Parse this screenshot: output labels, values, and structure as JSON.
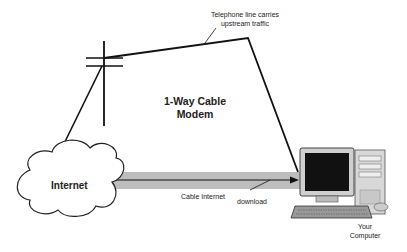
{
  "diagram": {
    "title_line1": "1-Way Cable",
    "title_line2": "Modem",
    "labels": {
      "telephone_line_1": "Telephone line carries",
      "telephone_line_2": "upstream traffic",
      "internet": "Internet",
      "cable_internet": "Cable Internet",
      "download": "download",
      "computer_line1": "Your",
      "computer_line2": "Computer"
    },
    "colors": {
      "line": "#111111",
      "band": "#b8b8b8",
      "background": "#ffffff"
    },
    "nodes": [
      "Internet cloud",
      "Telephone pole",
      "Your Computer"
    ],
    "edges": [
      {
        "from": "Internet",
        "to": "Telephone pole",
        "label": "Telephone line carries upstream traffic"
      },
      {
        "from": "Telephone pole",
        "to": "Your Computer",
        "label": "upstream"
      },
      {
        "from": "Internet",
        "to": "Your Computer",
        "label": "Cable Internet download"
      }
    ]
  }
}
